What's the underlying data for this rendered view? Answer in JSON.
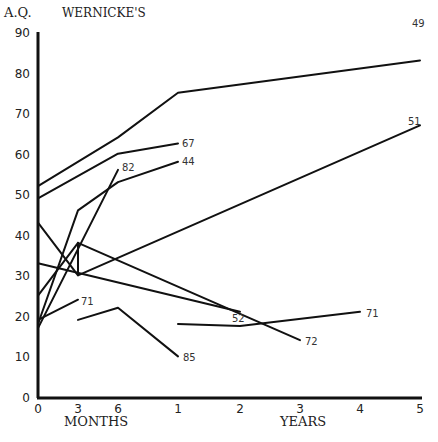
{
  "chart_data": {
    "type": "line",
    "title": "WERNICKE'S",
    "ylabel": "A.Q.",
    "xlabel_left": "MONTHS",
    "xlabel_right": "YEARS",
    "ylim": [
      0,
      90
    ],
    "yticks": [
      0,
      10,
      20,
      30,
      40,
      50,
      60,
      70,
      80,
      90
    ],
    "xticks": [
      {
        "label": "0",
        "px": 38
      },
      {
        "label": "3",
        "px": 78
      },
      {
        "label": "6",
        "px": 118
      },
      {
        "label": "1",
        "px": 178
      },
      {
        "label": "2",
        "px": 240
      },
      {
        "label": "3",
        "px": 300
      },
      {
        "label": "4",
        "px": 360
      },
      {
        "label": "5",
        "px": 420
      }
    ],
    "grid": false,
    "series": [
      {
        "name": "49",
        "points": [
          [
            38,
            52
          ],
          [
            118,
            64
          ],
          [
            178,
            75
          ],
          [
            420,
            83
          ]
        ]
      },
      {
        "name": "67",
        "points": [
          [
            38,
            49
          ],
          [
            118,
            60
          ],
          [
            178,
            62.5
          ]
        ]
      },
      {
        "name": "44",
        "points": [
          [
            38,
            18
          ],
          [
            78,
            46
          ],
          [
            118,
            53
          ],
          [
            178,
            58
          ]
        ]
      },
      {
        "name": "82",
        "points": [
          [
            38,
            17
          ],
          [
            118,
            56
          ]
        ]
      },
      {
        "name": "51",
        "points": [
          [
            38,
            25
          ],
          [
            78,
            38
          ],
          [
            78,
            30
          ],
          [
            420,
            67
          ]
        ]
      },
      {
        "name": "72",
        "points": [
          [
            38,
            43
          ],
          [
            78,
            30
          ]
        ]
      },
      {
        "name": "72b",
        "points": [
          [
            78,
            38
          ],
          [
            300,
            14
          ]
        ]
      },
      {
        "name": "52",
        "points": [
          [
            38,
            33
          ],
          [
            240,
            21
          ]
        ]
      },
      {
        "name": "71a",
        "points": [
          [
            38,
            19
          ],
          [
            78,
            24
          ]
        ]
      },
      {
        "name": "85",
        "points": [
          [
            78,
            19
          ],
          [
            118,
            22
          ],
          [
            178,
            10
          ]
        ]
      },
      {
        "name": "71b",
        "points": [
          [
            178,
            18
          ],
          [
            240,
            17.5
          ],
          [
            360,
            21
          ]
        ]
      }
    ],
    "labels": [
      {
        "text": "49",
        "px": [
          412,
          23
        ]
      },
      {
        "text": "51",
        "px": [
          408,
          121
        ]
      },
      {
        "text": "67",
        "px": [
          182,
          143
        ]
      },
      {
        "text": "44",
        "px": [
          182,
          161
        ]
      },
      {
        "text": "82",
        "px": [
          122,
          167
        ]
      },
      {
        "text": "71",
        "px": [
          81,
          301
        ]
      },
      {
        "text": "52",
        "px": [
          232,
          318
        ]
      },
      {
        "text": "72",
        "px": [
          305,
          341
        ]
      },
      {
        "text": "71",
        "px": [
          366,
          313
        ]
      },
      {
        "text": "85",
        "px": [
          183,
          357
        ]
      }
    ]
  }
}
